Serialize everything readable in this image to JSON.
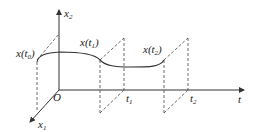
{
  "diagram": {
    "type": "3d state trajectory",
    "axes": {
      "vertical": {
        "label": "x",
        "sub": "2"
      },
      "horizontal": {
        "label": "t",
        "sub": ""
      },
      "depth": {
        "label": "x",
        "sub": "1"
      },
      "origin": "O"
    },
    "points": [
      {
        "label": "x(t",
        "sub": "0",
        "close": ")"
      },
      {
        "label": "x(t",
        "sub": "1",
        "close": ")"
      },
      {
        "label": "x(t",
        "sub": "2",
        "close": ")"
      }
    ],
    "ticks": [
      {
        "label": "t",
        "sub": "1"
      },
      {
        "label": "t",
        "sub": "2"
      }
    ]
  }
}
